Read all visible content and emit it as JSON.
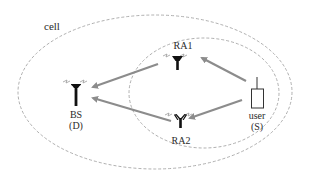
{
  "labels": {
    "cell": "cell",
    "ra1": "RA1",
    "ra2": "RA2",
    "bs_line1": "BS",
    "bs_line2": "(D)",
    "user_line1": "user",
    "user_line2": "(S)"
  },
  "nodes": [
    {
      "id": "BS",
      "role": "base station (destination)",
      "icon": "antenna-icon"
    },
    {
      "id": "RA1",
      "role": "relay antenna 1",
      "icon": "antenna-icon"
    },
    {
      "id": "RA2",
      "role": "relay antenna 2",
      "icon": "antenna-icon"
    },
    {
      "id": "user",
      "role": "user device (source)",
      "icon": "mobile-phone-icon"
    }
  ],
  "edges": [
    {
      "from": "user",
      "to": "RA1"
    },
    {
      "from": "user",
      "to": "RA2"
    },
    {
      "from": "RA1",
      "to": "BS"
    },
    {
      "from": "RA2",
      "to": "BS"
    }
  ],
  "regions": [
    {
      "name": "cell",
      "style": "dashed ellipse (outer)"
    },
    {
      "name": "relay-area",
      "style": "dashed ellipse (inner)"
    }
  ],
  "colors": {
    "ellipse": "#a6a6a6",
    "arrow": "#8c8c8c",
    "antenna": "#111111",
    "text": "#2a2a2a",
    "signal_mark": "#9a9a9a"
  }
}
